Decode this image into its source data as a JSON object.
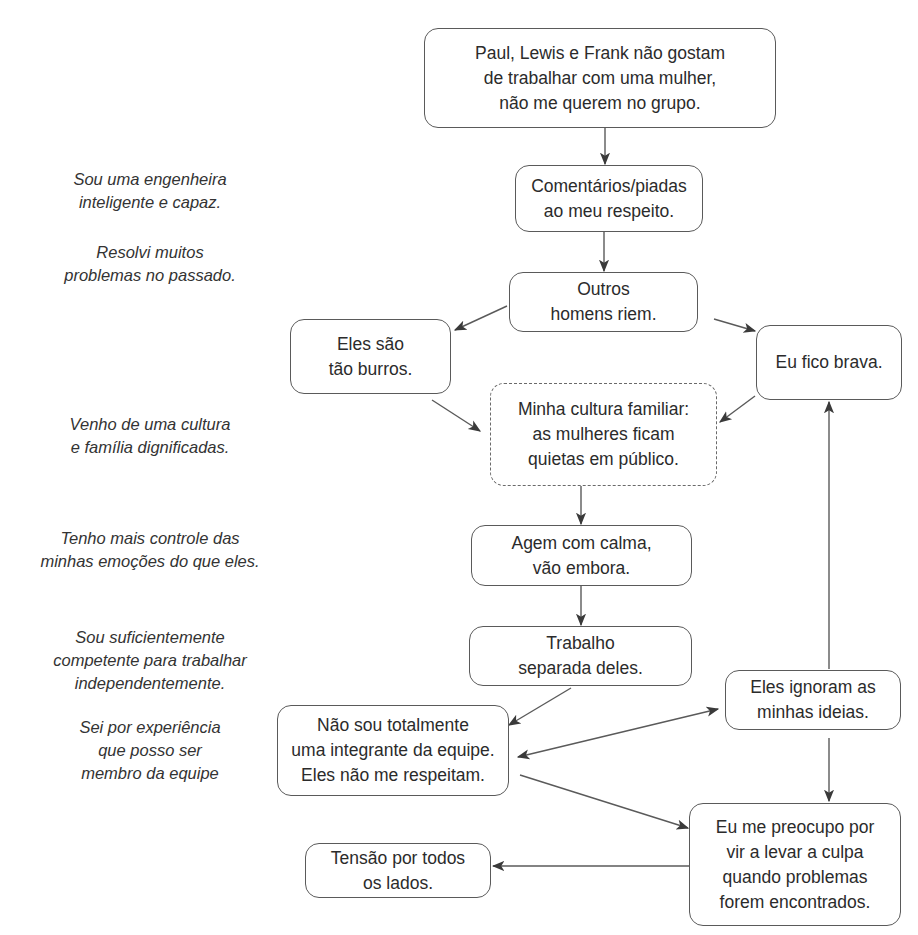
{
  "diagram": {
    "type": "flowchart",
    "nodes": {
      "n1": {
        "lines": [
          "Paul, Lewis e Frank não gostam",
          "de trabalhar com uma mulher,",
          "não me querem no grupo."
        ]
      },
      "n2": {
        "lines": [
          "Comentários/piadas",
          "ao meu respeito."
        ]
      },
      "n3": {
        "lines": [
          "Outros",
          "homens riem."
        ]
      },
      "n4": {
        "lines": [
          "Eles são",
          "tão burros."
        ]
      },
      "n5": {
        "lines": [
          "Eu fico brava."
        ]
      },
      "n6": {
        "lines": [
          "Minha cultura familiar:",
          "as mulheres ficam",
          "quietas em público."
        ],
        "style": "dashed"
      },
      "n7": {
        "lines": [
          "Agem com calma,",
          "vão embora."
        ]
      },
      "n8": {
        "lines": [
          "Trabalho",
          "separada deles."
        ]
      },
      "n9": {
        "lines": [
          "Eles ignoram as",
          "minhas ideias."
        ]
      },
      "n10": {
        "lines": [
          "Não sou totalmente",
          "uma integrante da equipe.",
          "Eles não me respeitam."
        ]
      },
      "n11": {
        "lines": [
          "Eu me preocupo por",
          "vir a levar a culpa",
          "quando problemas",
          "forem encontrados."
        ]
      },
      "n12": {
        "lines": [
          "Tensão por todos",
          "os lados."
        ]
      }
    },
    "notes": [
      {
        "lines": [
          "Sou uma engenheira",
          "inteligente e capaz."
        ]
      },
      {
        "lines": [
          "Resolvi muitos",
          "problemas no passado."
        ]
      },
      {
        "lines": [
          "Venho de uma cultura",
          "e família dignificadas."
        ]
      },
      {
        "lines": [
          "Tenho mais controle das",
          "minhas emoções do que eles."
        ]
      },
      {
        "lines": [
          "Sou suficientemente",
          "competente para trabalhar",
          "independentemente."
        ]
      },
      {
        "lines": [
          "Sei por experiência",
          "que posso ser",
          "membro da equipe"
        ]
      }
    ],
    "edges": [
      {
        "from": "n1",
        "to": "n2"
      },
      {
        "from": "n2",
        "to": "n3"
      },
      {
        "from": "n3",
        "to": "n4"
      },
      {
        "from": "n3",
        "to": "n5"
      },
      {
        "from": "n4",
        "to": "n6"
      },
      {
        "from": "n5",
        "to": "n6"
      },
      {
        "from": "n6",
        "to": "n7"
      },
      {
        "from": "n7",
        "to": "n8"
      },
      {
        "from": "n8",
        "to": "n10"
      },
      {
        "from": "n10",
        "to": "n9",
        "bidirectional": true
      },
      {
        "from": "n9",
        "to": "n5"
      },
      {
        "from": "n9",
        "to": "n11"
      },
      {
        "from": "n10",
        "to": "n11"
      },
      {
        "from": "n11",
        "to": "n12"
      }
    ],
    "colors": {
      "stroke": "#5a5a5a",
      "text": "#2b2b2b",
      "background": "#ffffff"
    }
  }
}
